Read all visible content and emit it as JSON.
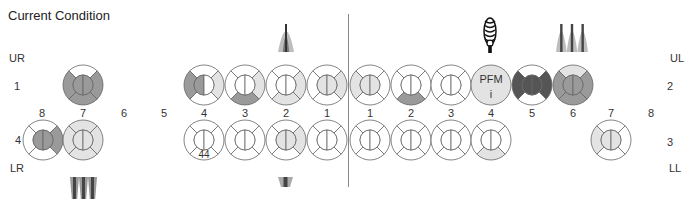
{
  "title": "Current Condition",
  "colors": {
    "white": "#ffffff",
    "light": "#e3e3e3",
    "mid": "#9a9a9a",
    "dark": "#555555",
    "stroke": "#666666"
  },
  "quadrants": {
    "upper_right": {
      "label": "UR",
      "number": "1"
    },
    "upper_left": {
      "label": "UL",
      "number": "2"
    },
    "lower_left": {
      "label": "LL",
      "number": "3"
    },
    "lower_right": {
      "label": "LR",
      "number": "4"
    }
  },
  "tooth_numbers": {
    "upper_right": [
      "8",
      "7",
      "6",
      "5",
      "4",
      "3",
      "2",
      "1"
    ],
    "upper_left": [
      "1",
      "2",
      "3",
      "4",
      "5",
      "6",
      "7",
      "8"
    ],
    "lower_right": [
      "8",
      "7",
      "4",
      "3",
      "2",
      "1"
    ],
    "lower_left": [
      "1",
      "2",
      "3",
      "4",
      "7"
    ]
  },
  "teeth": [
    {
      "id": "UR7",
      "cx": 83,
      "cy": 85,
      "top": "white",
      "right": "mid",
      "bottom": "mid",
      "left": "mid",
      "inner_l": "mid",
      "inner_r": "mid"
    },
    {
      "id": "UR4",
      "cx": 204,
      "cy": 85,
      "top": "white",
      "right": "light",
      "bottom": "white",
      "left": "mid",
      "inner_l": "mid",
      "inner_r": "white"
    },
    {
      "id": "UR3",
      "cx": 245,
      "cy": 85,
      "top": "white",
      "right": "light",
      "bottom": "mid",
      "left": "white",
      "inner_l": "white",
      "inner_r": "white"
    },
    {
      "id": "UR2",
      "cx": 286,
      "cy": 85,
      "top": "white",
      "right": "light",
      "bottom": "light",
      "left": "white",
      "inner_l": "white",
      "inner_r": "white"
    },
    {
      "id": "UR1",
      "cx": 327,
      "cy": 85,
      "top": "white",
      "right": "light",
      "bottom": "white",
      "left": "white",
      "inner_l": "light",
      "inner_r": "light"
    },
    {
      "id": "UL1",
      "cx": 370,
      "cy": 85,
      "top": "white",
      "right": "white",
      "bottom": "white",
      "left": "light",
      "inner_l": "light",
      "inner_r": "light"
    },
    {
      "id": "UL2",
      "cx": 411,
      "cy": 85,
      "top": "white",
      "right": "white",
      "bottom": "mid",
      "left": "white",
      "inner_l": "white",
      "inner_r": "white"
    },
    {
      "id": "UL3",
      "cx": 451,
      "cy": 85,
      "top": "white",
      "right": "white",
      "bottom": "white",
      "left": "white",
      "inner_l": "white",
      "inner_r": "white"
    },
    {
      "id": "UL5",
      "cx": 532,
      "cy": 85,
      "top": "white",
      "right": "dark",
      "bottom": "white",
      "left": "dark",
      "inner_l": "dark",
      "inner_r": "dark"
    },
    {
      "id": "UL6",
      "cx": 573,
      "cy": 85,
      "top": "light",
      "right": "mid",
      "bottom": "mid",
      "left": "mid",
      "inner_l": "mid",
      "inner_r": "mid"
    },
    {
      "id": "LR8",
      "cx": 43,
      "cy": 140,
      "top": "white",
      "right": "mid",
      "bottom": "white",
      "left": "white",
      "inner_l": "mid",
      "inner_r": "mid"
    },
    {
      "id": "LR7",
      "cx": 83,
      "cy": 140,
      "top": "light",
      "right": "light",
      "bottom": "light",
      "left": "light",
      "inner_l": "light",
      "inner_r": "light"
    },
    {
      "id": "LR4",
      "cx": 204,
      "cy": 140,
      "top": "white",
      "right": "white",
      "bottom": "white",
      "left": "white",
      "inner_l": "white",
      "inner_r": "white",
      "note": "44"
    },
    {
      "id": "LR3",
      "cx": 245,
      "cy": 140,
      "top": "white",
      "right": "white",
      "bottom": "white",
      "left": "white",
      "inner_l": "white",
      "inner_r": "white"
    },
    {
      "id": "LR2",
      "cx": 286,
      "cy": 140,
      "top": "white",
      "right": "light",
      "bottom": "white",
      "left": "white",
      "inner_l": "light",
      "inner_r": "light"
    },
    {
      "id": "LR1",
      "cx": 327,
      "cy": 140,
      "top": "white",
      "right": "white",
      "bottom": "white",
      "left": "white",
      "inner_l": "white",
      "inner_r": "white"
    },
    {
      "id": "LL1",
      "cx": 370,
      "cy": 140,
      "top": "white",
      "right": "white",
      "bottom": "white",
      "left": "white",
      "inner_l": "white",
      "inner_r": "white"
    },
    {
      "id": "LL2",
      "cx": 411,
      "cy": 140,
      "top": "white",
      "right": "white",
      "bottom": "white",
      "left": "white",
      "inner_l": "white",
      "inner_r": "white"
    },
    {
      "id": "LL3",
      "cx": 451,
      "cy": 140,
      "top": "white",
      "right": "white",
      "bottom": "white",
      "left": "white",
      "inner_l": "white",
      "inner_r": "white"
    },
    {
      "id": "LL4",
      "cx": 491,
      "cy": 140,
      "top": "white",
      "right": "white",
      "bottom": "light",
      "left": "white",
      "inner_l": "white",
      "inner_r": "white"
    },
    {
      "id": "LL7",
      "cx": 611,
      "cy": 140,
      "top": "white",
      "right": "white",
      "bottom": "white",
      "left": "light",
      "inner_l": "light",
      "inner_r": "light"
    }
  ],
  "crown": {
    "id": "UL4",
    "cx": 491,
    "cy": 85,
    "label": "PFM",
    "sub": "i",
    "fill": "light"
  },
  "roots": [
    {
      "id": "root-UR2",
      "type": "single",
      "x": 278,
      "y": 20,
      "w": 16,
      "h": 32,
      "dir": "up"
    },
    {
      "id": "root-UL4-implant",
      "type": "implant",
      "x": 483,
      "y": 18,
      "w": 14,
      "h": 35
    },
    {
      "id": "root-UL6",
      "type": "triple",
      "x": 556,
      "y": 20,
      "w": 32,
      "h": 32,
      "dir": "up"
    },
    {
      "id": "root-LR7",
      "type": "triple",
      "x": 70,
      "y": 177,
      "w": 27,
      "h": 22,
      "dir": "down"
    },
    {
      "id": "root-LR2",
      "type": "single-down",
      "x": 278,
      "y": 177,
      "w": 15,
      "h": 10,
      "dir": "down"
    }
  ]
}
